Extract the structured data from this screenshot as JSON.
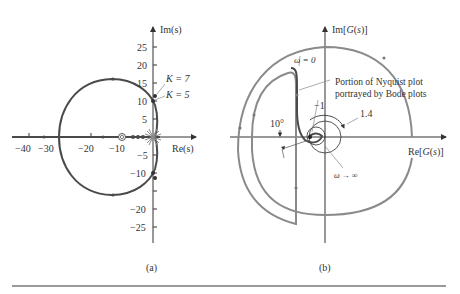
{
  "figure": {
    "panels": [
      {
        "id": "a",
        "caption": "(a)",
        "type": "root-locus",
        "axes": {
          "x_label": "Re(s)",
          "y_label": "Im(s)",
          "x_ticks": [
            "−40",
            "−30",
            "−20",
            "−10"
          ],
          "y_ticks_pos": [
            "25",
            "20",
            "15",
            "10",
            "5"
          ],
          "y_ticks_neg": [
            "−5",
            "−10",
            "−20",
            "−25"
          ]
        },
        "annotations": {
          "k7": "K = 7",
          "k5": "K = 5"
        }
      },
      {
        "id": "b",
        "caption": "(b)",
        "type": "nyquist",
        "axes": {
          "x_label": "Re[G(s)]",
          "y_label": "Im[G(s)]"
        },
        "annotations": {
          "omega0": "ω = 0",
          "portion_line1": "Portion of Nyquist plot",
          "portion_line2": "portrayed by Bode plots",
          "minus_one": "−1",
          "mag": "1.4",
          "angle": "10°",
          "omega_inf": "ω → ∞"
        }
      }
    ]
  },
  "colors": {
    "dark_curve": "#4a4a4a",
    "light_curve": "#8a8a8a",
    "axis": "#333333",
    "divider": "#9a9a9a"
  }
}
